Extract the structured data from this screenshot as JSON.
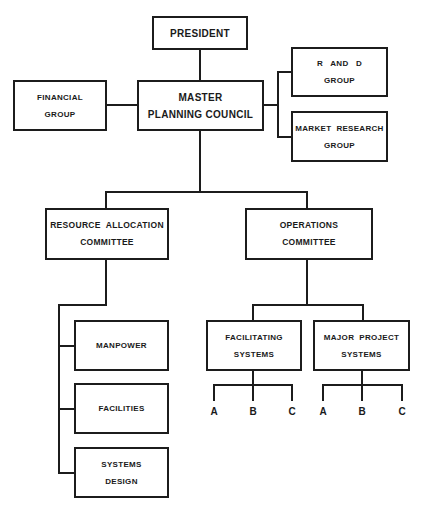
{
  "chart": {
    "type": "organization-chart",
    "nodes": {
      "president": {
        "lines": [
          "PRESIDENT"
        ]
      },
      "master_planning_council": {
        "lines": [
          "MASTER",
          "PLANNING COUNCIL"
        ]
      },
      "financial_group": {
        "lines": [
          "FINANCIAL",
          "GROUP"
        ]
      },
      "r_and_d_group": {
        "lines": [
          "R   AND   D",
          "GROUP"
        ]
      },
      "market_research_group": {
        "lines": [
          "MARKET  RESEARCH",
          "GROUP"
        ]
      },
      "resource_allocation_committee": {
        "lines": [
          "RESOURCE  ALLOCATION",
          "COMMITTEE"
        ]
      },
      "operations_committee": {
        "lines": [
          "OPERATIONS",
          "COMMITTEE"
        ]
      },
      "manpower": {
        "lines": [
          "MANPOWER"
        ]
      },
      "facilities": {
        "lines": [
          "FACILITIES"
        ]
      },
      "systems_design": {
        "lines": [
          "SYSTEMS",
          "DESIGN"
        ]
      },
      "facilitating_systems": {
        "lines": [
          "FACILITATING",
          "SYSTEMS"
        ],
        "children": [
          "A",
          "B",
          "C"
        ]
      },
      "major_project_systems": {
        "lines": [
          "MAJOR  PROJECT",
          "SYSTEMS"
        ],
        "children": [
          "A",
          "B",
          "C"
        ]
      }
    },
    "edges": [
      [
        "president",
        "master_planning_council"
      ],
      [
        "master_planning_council",
        "financial_group"
      ],
      [
        "master_planning_council",
        "r_and_d_group"
      ],
      [
        "master_planning_council",
        "market_research_group"
      ],
      [
        "master_planning_council",
        "resource_allocation_committee"
      ],
      [
        "master_planning_council",
        "operations_committee"
      ],
      [
        "resource_allocation_committee",
        "manpower"
      ],
      [
        "resource_allocation_committee",
        "facilities"
      ],
      [
        "resource_allocation_committee",
        "systems_design"
      ],
      [
        "operations_committee",
        "facilitating_systems"
      ],
      [
        "operations_committee",
        "major_project_systems"
      ]
    ]
  }
}
